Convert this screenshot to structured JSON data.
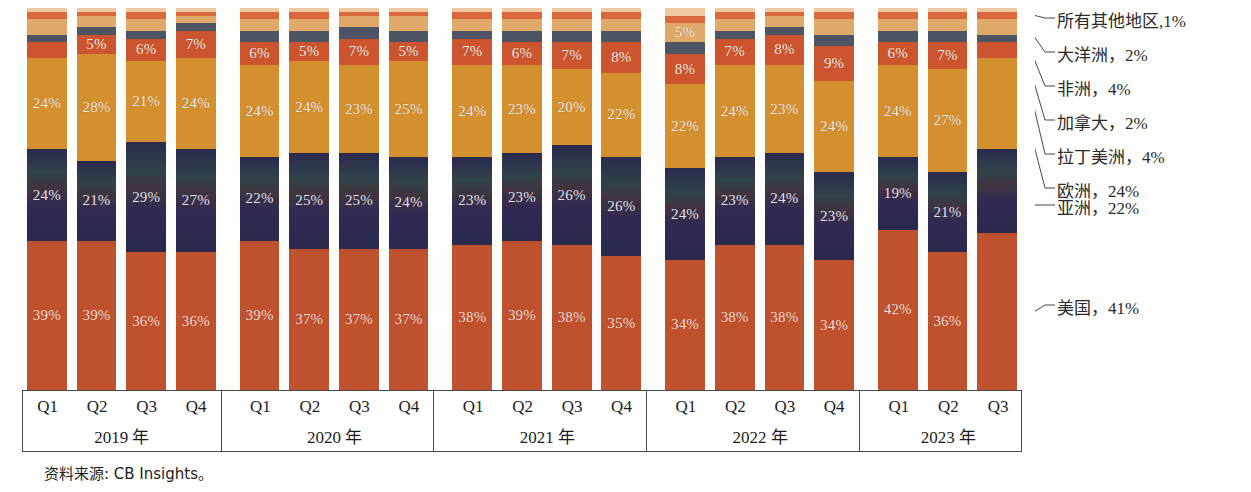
{
  "source_note": "资料来源: CB Insights。",
  "colors": {
    "us": "#c0512e",
    "asia": "#2b2a4e",
    "europe": "#d4902f",
    "latin_america": "#cc552f",
    "canada": "#4d5565",
    "africa": "#e0a96a",
    "oceania": "#d9693c",
    "all_other": "#eec9a4",
    "axis_line": "#4a4a4a",
    "label_text": "#f6ece2"
  },
  "legend": {
    "items": [
      {
        "name": "all_other",
        "label": "所有其他地区,1%"
      },
      {
        "name": "oceania",
        "label": "大洋洲，2%"
      },
      {
        "name": "africa",
        "label": "非洲，4%"
      },
      {
        "name": "canada",
        "label": "加拿大，2%"
      },
      {
        "name": "latin_america",
        "label": "拉丁美洲，4%"
      },
      {
        "name": "europe",
        "label": "欧洲，24%"
      },
      {
        "name": "asia",
        "label": "亚洲，22%"
      },
      {
        "name": "us",
        "label": "美国，41%"
      }
    ]
  },
  "chart_data": {
    "type": "bar",
    "subtype": "stacked-percent",
    "title": "",
    "xlabel": "",
    "ylabel": "",
    "ylim": [
      0,
      100
    ],
    "grid": false,
    "legend_position": "right-callouts",
    "stack_order_bottom_to_top": [
      "us",
      "asia",
      "europe",
      "latin_america",
      "canada",
      "africa",
      "oceania",
      "all_other"
    ],
    "series": [
      {
        "name": "us",
        "label": "美国",
        "color": "#c0512e"
      },
      {
        "name": "asia",
        "label": "亚洲",
        "color": "#2b2a4e"
      },
      {
        "name": "europe",
        "label": "欧洲",
        "color": "#d4902f"
      },
      {
        "name": "latin_america",
        "label": "拉丁美洲",
        "color": "#cc552f"
      },
      {
        "name": "canada",
        "label": "加拿大",
        "color": "#4d5565"
      },
      {
        "name": "africa",
        "label": "非洲",
        "color": "#e0a96a"
      },
      {
        "name": "oceania",
        "label": "大洋洲",
        "color": "#d9693c"
      },
      {
        "name": "all_other",
        "label": "所有其他地区",
        "color": "#eec9a4"
      }
    ],
    "groups": [
      {
        "year": "2019 年",
        "quarters": [
          "Q1",
          "Q2",
          "Q3",
          "Q4"
        ],
        "bars": [
          {
            "quarter": "Q1",
            "us": 39,
            "asia": 24,
            "europe": 24,
            "latin_america": 4,
            "canada": 2,
            "africa": 4,
            "oceania": 2,
            "all_other": 1,
            "labels": {
              "us": "39%",
              "asia": "24%",
              "europe": "24%"
            }
          },
          {
            "quarter": "Q2",
            "us": 39,
            "asia": 21,
            "europe": 28,
            "latin_america": 5,
            "canada": 2,
            "africa": 3,
            "oceania": 1,
            "all_other": 1,
            "labels": {
              "us": "39%",
              "asia": "21%",
              "europe": "28%",
              "latin_america": "5%"
            }
          },
          {
            "quarter": "Q3",
            "us": 36,
            "asia": 29,
            "europe": 21,
            "latin_america": 6,
            "canada": 2,
            "africa": 3,
            "oceania": 2,
            "all_other": 1,
            "labels": {
              "us": "36%",
              "asia": "29%",
              "europe": "21%",
              "latin_america": "6%"
            }
          },
          {
            "quarter": "Q4",
            "us": 36,
            "asia": 27,
            "europe": 24,
            "latin_america": 7,
            "canada": 2,
            "africa": 2,
            "oceania": 1,
            "all_other": 1,
            "labels": {
              "us": "36%",
              "asia": "27%",
              "europe": "24%",
              "latin_america": "7%"
            }
          }
        ]
      },
      {
        "year": "2020 年",
        "quarters": [
          "Q1",
          "Q2",
          "Q3",
          "Q4"
        ],
        "bars": [
          {
            "quarter": "Q1",
            "us": 39,
            "asia": 22,
            "europe": 24,
            "latin_america": 6,
            "canada": 3,
            "africa": 3,
            "oceania": 2,
            "all_other": 1,
            "labels": {
              "us": "39%",
              "asia": "22%",
              "europe": "24%",
              "latin_america": "6%"
            }
          },
          {
            "quarter": "Q2",
            "us": 37,
            "asia": 25,
            "europe": 24,
            "latin_america": 5,
            "canada": 3,
            "africa": 3,
            "oceania": 2,
            "all_other": 1,
            "labels": {
              "us": "37%",
              "asia": "25%",
              "europe": "24%",
              "latin_america": "5%"
            }
          },
          {
            "quarter": "Q3",
            "us": 37,
            "asia": 25,
            "europe": 23,
            "latin_america": 7,
            "canada": 3,
            "africa": 3,
            "oceania": 1,
            "all_other": 1,
            "labels": {
              "us": "37%",
              "asia": "25%",
              "europe": "23%",
              "latin_america": "7%"
            }
          },
          {
            "quarter": "Q4",
            "us": 37,
            "asia": 24,
            "europe": 25,
            "latin_america": 5,
            "canada": 3,
            "africa": 4,
            "oceania": 1,
            "all_other": 1,
            "labels": {
              "us": "37%",
              "asia": "24%",
              "europe": "25%",
              "latin_america": "5%"
            }
          }
        ]
      },
      {
        "year": "2021 年",
        "quarters": [
          "Q1",
          "Q2",
          "Q3",
          "Q4"
        ],
        "bars": [
          {
            "quarter": "Q1",
            "us": 38,
            "asia": 23,
            "europe": 24,
            "latin_america": 7,
            "canada": 2,
            "africa": 3,
            "oceania": 2,
            "all_other": 1,
            "labels": {
              "us": "38%",
              "asia": "23%",
              "europe": "24%",
              "latin_america": "7%"
            }
          },
          {
            "quarter": "Q2",
            "us": 39,
            "asia": 23,
            "europe": 23,
            "latin_america": 6,
            "canada": 3,
            "africa": 3,
            "oceania": 2,
            "all_other": 1,
            "labels": {
              "us": "39%",
              "asia": "23%",
              "europe": "23%",
              "latin_america": "6%"
            }
          },
          {
            "quarter": "Q3",
            "us": 38,
            "asia": 26,
            "europe": 20,
            "latin_america": 7,
            "canada": 3,
            "africa": 3,
            "oceania": 2,
            "all_other": 1,
            "labels": {
              "us": "38%",
              "asia": "26%",
              "europe": "20%",
              "latin_america": "7%"
            }
          },
          {
            "quarter": "Q4",
            "us": 35,
            "asia": 26,
            "europe": 22,
            "latin_america": 8,
            "canada": 3,
            "africa": 3,
            "oceania": 2,
            "all_other": 1,
            "labels": {
              "us": "35%",
              "asia": "26%",
              "europe": "22%",
              "latin_america": "8%"
            }
          }
        ]
      },
      {
        "year": "2022 年",
        "quarters": [
          "Q1",
          "Q2",
          "Q3",
          "Q4"
        ],
        "bars": [
          {
            "quarter": "Q1",
            "us": 34,
            "asia": 24,
            "europe": 22,
            "latin_america": 8,
            "canada": 3,
            "africa": 5,
            "oceania": 2,
            "all_other": 2,
            "labels": {
              "us": "34%",
              "asia": "24%",
              "europe": "22%",
              "latin_america": "8%",
              "africa": "5%"
            }
          },
          {
            "quarter": "Q2",
            "us": 38,
            "asia": 23,
            "europe": 24,
            "latin_america": 7,
            "canada": 2,
            "africa": 3,
            "oceania": 2,
            "all_other": 1,
            "labels": {
              "us": "38%",
              "asia": "23%",
              "europe": "24%",
              "latin_america": "7%"
            }
          },
          {
            "quarter": "Q3",
            "us": 38,
            "asia": 24,
            "europe": 23,
            "latin_america": 8,
            "canada": 2,
            "africa": 3,
            "oceania": 1,
            "all_other": 1,
            "labels": {
              "us": "38%",
              "asia": "24%",
              "europe": "23%",
              "latin_america": "8%"
            }
          },
          {
            "quarter": "Q4",
            "us": 34,
            "asia": 23,
            "europe": 24,
            "latin_america": 9,
            "canada": 3,
            "africa": 4,
            "oceania": 2,
            "all_other": 1,
            "labels": {
              "us": "34%",
              "asia": "23%",
              "europe": "24%",
              "latin_america": "9%"
            }
          }
        ]
      },
      {
        "year": "2023 年",
        "quarters": [
          "Q1",
          "Q2",
          "Q3"
        ],
        "bars": [
          {
            "quarter": "Q1",
            "us": 42,
            "asia": 19,
            "europe": 24,
            "latin_america": 6,
            "canada": 3,
            "africa": 3,
            "oceania": 2,
            "all_other": 1,
            "labels": {
              "us": "42%",
              "asia": "19%",
              "europe": "24%",
              "latin_america": "6%"
            }
          },
          {
            "quarter": "Q2",
            "us": 36,
            "asia": 21,
            "europe": 27,
            "latin_america": 7,
            "canada": 3,
            "africa": 3,
            "oceania": 2,
            "all_other": 1,
            "labels": {
              "us": "36%",
              "asia": "21%",
              "europe": "27%",
              "latin_america": "7%"
            }
          },
          {
            "quarter": "Q3",
            "us": 41,
            "asia": 22,
            "europe": 24,
            "latin_america": 4,
            "canada": 2,
            "africa": 4,
            "oceania": 2,
            "all_other": 1,
            "labels": {}
          }
        ]
      }
    ]
  }
}
